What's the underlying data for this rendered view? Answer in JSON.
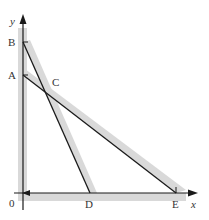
{
  "diagram": {
    "type": "coordinate-geometry",
    "axes": {
      "x_label": "x",
      "y_label": "y",
      "origin_label": "0"
    },
    "points": {
      "A": {
        "label": "A",
        "px": [
          23,
          75
        ]
      },
      "B": {
        "label": "B",
        "px": [
          23,
          42
        ]
      },
      "C": {
        "label": "C",
        "px": [
          45,
          94
        ]
      },
      "D": {
        "label": "D",
        "px": [
          90,
          193
        ]
      },
      "E": {
        "label": "E",
        "px": [
          176,
          193
        ]
      }
    },
    "lines": [
      {
        "name": "line-BD",
        "from": "B",
        "to": "D"
      },
      {
        "name": "line-AE",
        "from": "A",
        "to": "E"
      }
    ],
    "shading": {
      "color": "#d9d9d9",
      "regions": [
        "along y-axis",
        "along x-axis",
        "along line BD",
        "along line AE"
      ]
    },
    "colors": {
      "line": "#1a1a1a",
      "shade": "#d9d9d9",
      "label": "#333333"
    }
  }
}
